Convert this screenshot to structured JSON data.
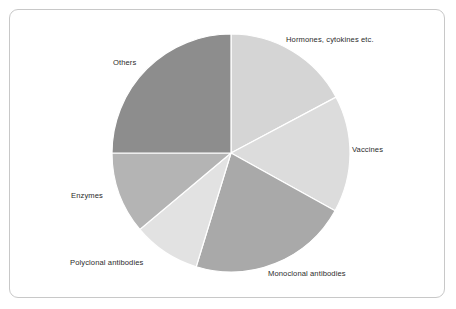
{
  "figure": {
    "frame_color": "#c8c8c8",
    "background": "#ffffff"
  },
  "chart_data": {
    "type": "pie",
    "title": "",
    "subtitle": "",
    "xlabel": "",
    "ylabel": "",
    "legend_position": "none",
    "grid": false,
    "labels_position": "outside",
    "start_angle_deg": 0,
    "direction": "clockwise",
    "center_px": [
      231,
      153
    ],
    "radius_px": 119,
    "categories": [
      "Hormones, cytokines etc.",
      "Vaccines",
      "Monoclonal antibodies",
      "Polyclonal antibodies",
      "Enzymes",
      "Others"
    ],
    "values": [
      17,
      16,
      22,
      9,
      11,
      25
    ],
    "value_unit": "%",
    "angles_deg": [
      62,
      57,
      78,
      33,
      40,
      90
    ],
    "colors": [
      "#d5d5d5",
      "#dcdcdc",
      "#a9a9a9",
      "#e2e2e2",
      "#b4b4b4",
      "#8d8d8d"
    ],
    "slices": [
      {
        "label": "Hormones, cytokines etc.",
        "value": 17,
        "start_deg": 0,
        "end_deg": 62,
        "color": "#d5d5d5"
      },
      {
        "label": "Vaccines",
        "value": 16,
        "start_deg": 62,
        "end_deg": 119,
        "color": "#dcdcdc"
      },
      {
        "label": "Monoclonal antibodies",
        "value": 22,
        "start_deg": 119,
        "end_deg": 197,
        "color": "#a9a9a9"
      },
      {
        "label": "Polyclonal antibodies",
        "value": 9,
        "start_deg": 197,
        "end_deg": 230,
        "color": "#e2e2e2"
      },
      {
        "label": "Enzymes",
        "value": 11,
        "start_deg": 230,
        "end_deg": 270,
        "color": "#b4b4b4"
      },
      {
        "label": "Others",
        "value": 25,
        "start_deg": 270,
        "end_deg": 360,
        "color": "#8d8d8d"
      }
    ]
  },
  "labels": {
    "hormones": "Hormones, cytokines etc.",
    "vaccines": "Vaccines",
    "monoclonal": "Monoclonal antibodies",
    "polyclonal": "Polyclonal antibodies",
    "enzymes": "Enzymes",
    "others": "Others"
  }
}
